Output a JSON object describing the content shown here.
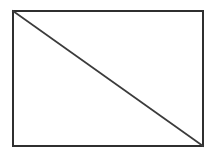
{
  "figure": {
    "name": "rectangle-with-diagonal",
    "canvas": {
      "width": 213,
      "height": 156,
      "background_color": "#ffffff"
    },
    "shapes": {
      "rectangle": {
        "label": "rectangle",
        "x": 13,
        "y": 11,
        "width": 190,
        "height": 135,
        "stroke_color": "#2f2f2f",
        "stroke_width": 2,
        "fill_color": "#ffffff"
      },
      "diagonal": {
        "label": "diagonal",
        "x1": 13,
        "y1": 11,
        "x2": 203,
        "y2": 146,
        "from_corner": "top-left",
        "to_corner": "bottom-right",
        "stroke_color": "#3b3b3b",
        "stroke_width": 1.7
      }
    },
    "corners": {
      "top_left": "13,11",
      "top_right": "203,11",
      "bottom_right": "203,146",
      "bottom_left": "13,146"
    },
    "labels": [],
    "text": ""
  }
}
